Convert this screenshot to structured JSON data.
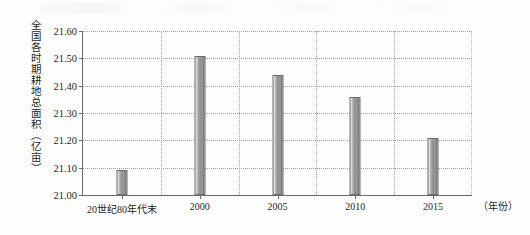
{
  "chart_data": {
    "type": "bar",
    "title": "",
    "xlabel": "（年份）",
    "ylabel": "全国各时期耕地总面积（亿亩）",
    "categories": [
      "20世纪80年代末",
      "2000",
      "2005",
      "2010",
      "2015"
    ],
    "values": [
      21.09,
      21.51,
      21.44,
      21.36,
      21.21
    ],
    "ylim": [
      21.0,
      21.6
    ],
    "yticks": [
      "21.00",
      "21.10",
      "21.20",
      "21.30",
      "21.40",
      "21.50",
      "21.60"
    ],
    "ytick_values": [
      21.0,
      21.1,
      21.2,
      21.3,
      21.4,
      21.5,
      21.6
    ],
    "grid": "horizontal-and-vertical-dotted",
    "legend": "none",
    "bar_color": "#949494",
    "axis_color": "#6a6a6a",
    "grid_color": "#9d9d9d"
  }
}
